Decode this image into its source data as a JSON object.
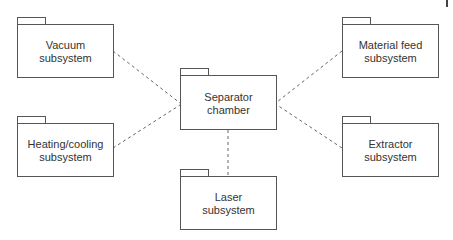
{
  "diagram": {
    "type": "UML package diagram",
    "line_color": "#555555",
    "connector_style": "dashed",
    "center": {
      "id": "separator",
      "label_line1": "Separator",
      "label_line2": "chamber"
    },
    "packages": [
      {
        "id": "vacuum",
        "label_line1": "Vacuum",
        "label_line2": "subsystem"
      },
      {
        "id": "heating",
        "label_line1": "Heating/cooling",
        "label_line2": "subsystem"
      },
      {
        "id": "material-feed",
        "label_line1": "Material feed",
        "label_line2": "subsystem"
      },
      {
        "id": "extractor",
        "label_line1": "Extractor",
        "label_line2": "subsystem"
      },
      {
        "id": "laser",
        "label_line1": "Laser",
        "label_line2": "subsystem"
      }
    ],
    "links": [
      {
        "from": "vacuum",
        "to": "separator"
      },
      {
        "from": "heating",
        "to": "separator"
      },
      {
        "from": "material-feed",
        "to": "separator"
      },
      {
        "from": "extractor",
        "to": "separator"
      },
      {
        "from": "laser",
        "to": "separator"
      }
    ]
  }
}
